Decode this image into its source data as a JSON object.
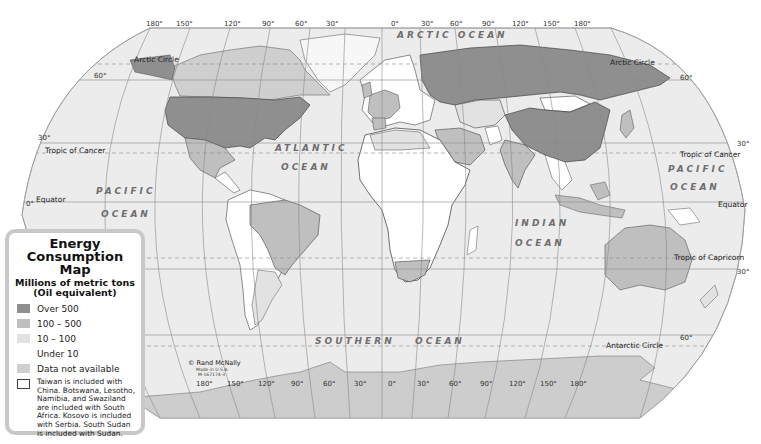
{
  "legend": {
    "title": "Energy Consumption Map",
    "title_line1": "Energy",
    "title_line2": "Consumption Map",
    "subtitle_line1": "Millions of metric tons",
    "subtitle_line2": "(Oil equivalent)",
    "items": [
      {
        "label": "Over 500",
        "color": "#8f8f8f"
      },
      {
        "label": "100 – 500",
        "color": "#bfbfbf"
      },
      {
        "label": "10 – 100",
        "color": "#e2e2e2"
      },
      {
        "label": "Under 10",
        "color": "#ffffff"
      },
      {
        "label": "Data not available",
        "color": "#cfcfcf"
      }
    ],
    "note": "Taiwan is included with China. Botswana, Lesotho, Namibia, and Swaziland are included with South Africa. Kosovo is included with Serbia. South Sudan is included with Sudan."
  },
  "graticule": {
    "top_longitudes": [
      "180°",
      "150°",
      "120°",
      "90°",
      "60°",
      "30°",
      "0°",
      "30°",
      "60°",
      "90°",
      "120°",
      "150°",
      "180°"
    ],
    "bottom_longitudes": [
      "180°",
      "150°",
      "120°",
      "90°",
      "60°",
      "30°",
      "0°",
      "30°",
      "60°",
      "90°",
      "120°",
      "150°",
      "180°"
    ],
    "left_latitudes": [
      "60°",
      "30°",
      "0°"
    ],
    "right_latitudes": [
      "60°",
      "30°",
      "30°",
      "60°"
    ]
  },
  "lines": {
    "arctic_circle": "Arctic Circle",
    "tropic_cancer": "Tropic of Cancer",
    "equator": "Equator",
    "tropic_capricorn": "Tropic of Capricorn",
    "antarctic_circle": "Antarctic Circle"
  },
  "oceans": {
    "arctic": "ARCTIC OCEAN",
    "atlantic_1": "ATLANTIC",
    "atlantic_2": "OCEAN",
    "pacific_w_1": "PACIFIC",
    "pacific_w_2": "OCEAN",
    "pacific_e_1": "PACIFIC",
    "pacific_e_2": "OCEAN",
    "indian_1": "INDIAN",
    "indian_2": "OCEAN",
    "southern": "SOUTHERN OCEAN",
    "southern_1": "SOUTHERN",
    "southern_2": "OCEAN"
  },
  "credit": {
    "line1": "© Rand McNally",
    "line2": "Made in U.S.A.",
    "line3": "M-167174-3"
  },
  "colors": {
    "ocean": "#ececec",
    "over_500": "#8f8f8f",
    "c100_500": "#bfbfbf",
    "c10_100": "#e2e2e2",
    "under_10": "#ffffff",
    "no_data": "#cfcfcf",
    "antarctica": "#cdcdcd"
  },
  "regions": {
    "over_500": [
      "United States",
      "Canada",
      "Russia",
      "China",
      "India",
      "Japan"
    ],
    "100_500": [
      "Mexico",
      "Brazil",
      "Australia",
      "South Africa",
      "Saudi Arabia",
      "Iran",
      "Germany",
      "France",
      "United Kingdom",
      "Korea",
      "Indonesia"
    ],
    "10_100": [
      "Argentina",
      "Greenland",
      "Kazakhstan",
      "Egypt",
      "Algeria"
    ],
    "under_10": [
      "Most of Africa",
      "Mongolia",
      "Afghanistan",
      "Central America",
      "Papua New Guinea"
    ]
  }
}
